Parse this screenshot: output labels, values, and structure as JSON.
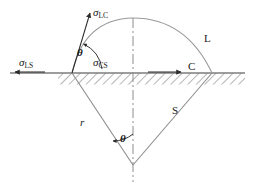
{
  "figure": {
    "background_color": "#ffffff",
    "line_color": "#7a7a7a",
    "dark_line_color": "#3c3c3c",
    "text_color": "#1a1a1a",
    "width": 256,
    "height": 191
  },
  "labels": {
    "sigma_lc": {
      "symbol": "σ",
      "subscript": "LC"
    },
    "sigma_ls": {
      "symbol": "σ",
      "subscript": "LS"
    },
    "sigma_cs": {
      "symbol": "σ",
      "subscript": "CS"
    },
    "phase_l": "L",
    "phase_c": "C",
    "phase_s": "S",
    "radius": "r",
    "theta_top": "θ",
    "theta_bottom": "θ"
  },
  "geometry": {
    "baseline_y": 73,
    "baseline_x_start": 10,
    "baseline_x_end": 245,
    "hatch_x_start": 58,
    "hatch_x_end": 245,
    "hatch_height": 11,
    "contact_point_left_x": 72,
    "contact_point_right_x": 212,
    "wedge_apex_x": 133,
    "wedge_apex_y": 165,
    "centerline_x": 133,
    "centerline_y_top": 18,
    "centerline_y_bottom": 182,
    "arc_peak_y": 18,
    "sigma_lc_arrow": {
      "x1": 72,
      "y1": 73,
      "x2": 90,
      "y2": 13
    },
    "sigma_ls_arrow": {
      "x1": 45,
      "y1": 72,
      "x2": 14,
      "y2": 72
    },
    "sigma_cs_arrow": {
      "x1": 148,
      "y1": 72,
      "x2": 182,
      "y2": 72
    }
  },
  "annotations": {
    "theta_top_note": "contact angle at the three-phase junction",
    "theta_bottom_note": "half-angle of the wedge at the apex"
  }
}
